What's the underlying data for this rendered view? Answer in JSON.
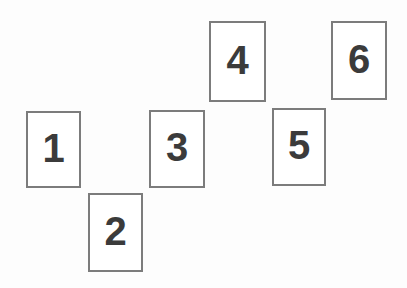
{
  "scene": {
    "title": "Numbered card layout",
    "background_color": "#fdfdfd",
    "width": 407,
    "height": 288
  },
  "style": {
    "card_fill": "#ffffff",
    "card_border_color": "#7c7c7c",
    "card_border_width": 2,
    "number_color": "#3b3b3b",
    "number_font_size": 40
  },
  "cards": [
    {
      "label": "1",
      "x": 26,
      "y": 111,
      "w": 55,
      "h": 77
    },
    {
      "label": "2",
      "x": 88,
      "y": 193,
      "w": 55,
      "h": 79
    },
    {
      "label": "3",
      "x": 149,
      "y": 110,
      "w": 56,
      "h": 78
    },
    {
      "label": "4",
      "x": 209,
      "y": 21,
      "w": 57,
      "h": 81
    },
    {
      "label": "5",
      "x": 272,
      "y": 108,
      "w": 54,
      "h": 78
    },
    {
      "label": "6",
      "x": 331,
      "y": 21,
      "w": 56,
      "h": 79
    }
  ]
}
